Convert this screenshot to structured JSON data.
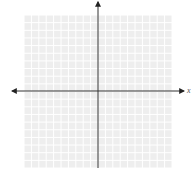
{
  "figure": {
    "type": "coordinate-plane",
    "x_axis_label": "x",
    "grid_cells_x": 20,
    "grid_cells_y": 20,
    "colors": {
      "background": "#ffffff",
      "grid_fill": "#eeeeee",
      "grid_line": "#ffffff",
      "axis": "#333333"
    }
  }
}
